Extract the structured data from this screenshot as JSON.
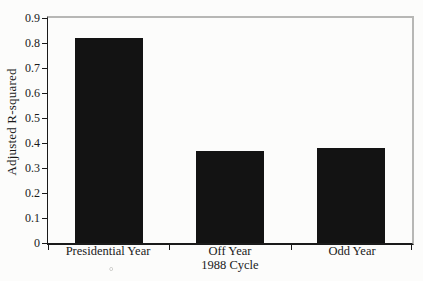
{
  "figure": {
    "artifact_mark": "°"
  },
  "colors": {
    "background": "#fcfcfb",
    "ink": "#1a1a1a",
    "bar": "#131313",
    "frame_gray": "#b7b7b5"
  },
  "chart_data": {
    "type": "bar",
    "categories": [
      "Presidential Year",
      "Off Year",
      "Odd Year"
    ],
    "values": [
      0.82,
      0.37,
      0.38
    ],
    "title": "",
    "xlabel": "1988 Cycle",
    "ylabel": "Adjusted R-squared",
    "ylim": [
      0,
      0.9
    ],
    "yticks": [
      0,
      0.1,
      0.2,
      0.3,
      0.4,
      0.5,
      0.6,
      0.7,
      0.8,
      0.9
    ],
    "ytick_labels": [
      "0",
      "0.1",
      "0.2",
      "0.3",
      "0.4",
      "0.5",
      "0.6",
      "0.7",
      "0.8",
      "0.9"
    ],
    "bar_color": "#131313",
    "grid": false,
    "legend": "none",
    "frame": "gray top and right, black left and bottom axes"
  }
}
